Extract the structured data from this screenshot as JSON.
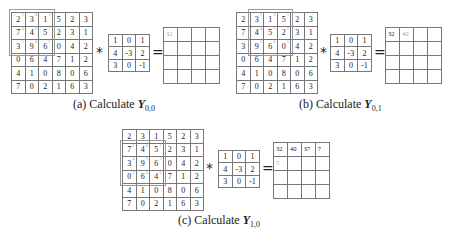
{
  "input_matrix": [
    [
      2,
      3,
      1,
      5,
      2,
      3
    ],
    [
      7,
      4,
      5,
      2,
      3,
      1
    ],
    [
      3,
      9,
      6,
      0,
      4,
      2
    ],
    [
      0,
      6,
      4,
      7,
      1,
      2
    ],
    [
      4,
      1,
      0,
      8,
      0,
      6
    ],
    [
      7,
      0,
      2,
      1,
      6,
      3
    ]
  ],
  "kernel": [
    [
      1,
      0,
      1
    ],
    [
      4,
      -3,
      2
    ],
    [
      3,
      0,
      -1
    ]
  ],
  "operators": {
    "convolve": "*",
    "equals": "="
  },
  "panels": [
    {
      "id": "a",
      "caption_prefix": "(a) Calculate ",
      "caption_var": "Y",
      "caption_sub": "0,0",
      "window": {
        "row": 0,
        "col": 0
      },
      "output_values": [
        [
          "32",
          "",
          "",
          ""
        ],
        [
          "",
          "",
          "",
          ""
        ],
        [
          "",
          "",
          "",
          ""
        ],
        [
          "",
          "",
          "",
          ""
        ]
      ],
      "output_highlight": [
        0,
        0
      ]
    },
    {
      "id": "b",
      "caption_prefix": "(b) Calculate ",
      "caption_var": "Y",
      "caption_sub": "0,1",
      "window": {
        "row": 0,
        "col": 1
      },
      "output_values": [
        [
          "32",
          "40",
          "",
          ""
        ],
        [
          "",
          "",
          "",
          ""
        ],
        [
          "",
          "",
          "",
          ""
        ],
        [
          "",
          "",
          "",
          ""
        ]
      ],
      "output_highlight": [
        0,
        1
      ]
    },
    {
      "id": "c",
      "caption_prefix": "(c) Calculate ",
      "caption_var": "Y",
      "caption_sub": "1,0",
      "window": {
        "row": 1,
        "col": 0
      },
      "output_values": [
        [
          "32",
          "40",
          "37",
          "7"
        ],
        [
          "5",
          "",
          "",
          ""
        ],
        [
          "",
          "",
          "",
          ""
        ],
        [
          "",
          "",
          "",
          ""
        ]
      ],
      "output_highlight": [
        1,
        0
      ]
    }
  ],
  "layout": {
    "a": {
      "input": [
        11,
        12
      ],
      "kernel": [
        108,
        34
      ],
      "star": [
        96,
        44
      ],
      "eq": [
        152,
        44
      ],
      "output": [
        163,
        27
      ],
      "caption": [
        73,
        97
      ]
    },
    "b": {
      "input": [
        236,
        12
      ],
      "kernel": [
        330,
        34
      ],
      "star": [
        320,
        44
      ],
      "eq": [
        374,
        44
      ],
      "output": [
        385,
        27
      ],
      "caption": [
        299,
        97
      ]
    },
    "c": {
      "input": [
        122,
        129
      ],
      "kernel": [
        218,
        150
      ],
      "star": [
        206,
        160
      ],
      "eq": [
        262,
        160
      ],
      "output": [
        273,
        142
      ],
      "caption": [
        178,
        213
      ]
    }
  }
}
